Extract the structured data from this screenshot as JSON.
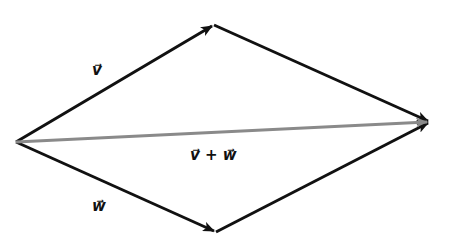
{
  "diagram": {
    "points": {
      "origin": [
        16,
        142
      ],
      "v_tip": [
        214,
        25
      ],
      "sum_tip": [
        430,
        122
      ],
      "w_tip": [
        216,
        232
      ]
    },
    "colors": {
      "vector": "#111111",
      "sum_vector": "#8a8a8a",
      "background": "#ffffff"
    },
    "labels": {
      "v": "v⃗",
      "w": "w⃗",
      "sum": "v⃗ + w⃗"
    }
  }
}
